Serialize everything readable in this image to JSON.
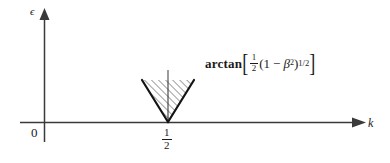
{
  "figure": {
    "type": "math-diagram",
    "background_color": "#ffffff",
    "line_color": "#1a1a1a",
    "axes": {
      "vertical": {
        "label": "ϵ",
        "name": "epsilon",
        "arrow": "up"
      },
      "horizontal": {
        "label": "k",
        "name": "wavenumber",
        "arrow": "right"
      },
      "origin_label": "0"
    },
    "tick": {
      "x_value_numerator": "1",
      "x_value_denominator": "2",
      "x_value_text": "1/2"
    },
    "annotation": {
      "function_name": "arctan",
      "open_bracket": "[",
      "coefficient_numerator": "1",
      "coefficient_denominator": "2",
      "open_paren": "(",
      "one": "1",
      "minus": "−",
      "beta": "β",
      "beta_exponent": "2",
      "close_paren": ")",
      "power_numerator": "1",
      "power_denominator": "2",
      "power_text": "1/2",
      "close_bracket": "]",
      "full_text": "arctan[ (1/2)(1 − β²)^(1/2) ]"
    },
    "wedge": {
      "description": "downward hatched wedge with apex on the k-axis at k = 1/2",
      "apex_x": 168,
      "apex_y": 122,
      "top_left_x": 142,
      "top_left_y": 80,
      "top_right_x": 194,
      "top_right_y": 80,
      "hatch_angle_deg": 45,
      "has_center_line": true
    }
  }
}
